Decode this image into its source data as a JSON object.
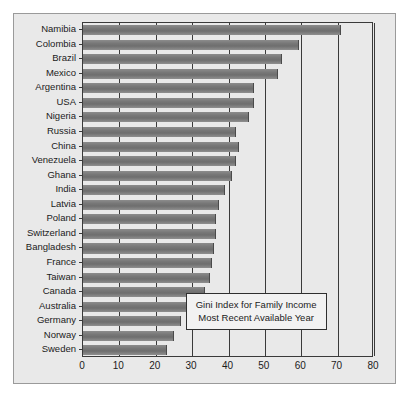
{
  "chart_data": {
    "type": "bar",
    "orientation": "horizontal",
    "title": "",
    "xlabel": "",
    "ylabel": "",
    "xlim": [
      0,
      80
    ],
    "xticks": [
      0,
      10,
      20,
      30,
      40,
      50,
      60,
      70,
      80
    ],
    "grid": true,
    "grid_axis": "x",
    "legend": "none",
    "annotation": {
      "line1": "Gini Index for Family Income",
      "line2": "Most Recent Available Year"
    },
    "categories": [
      "Namibia",
      "Colombia",
      "Brazil",
      "Mexico",
      "Argentina",
      "USA",
      "Nigeria",
      "Russia",
      "China",
      "Venezuela",
      "Ghana",
      "India",
      "Latvia",
      "Poland",
      "Switzerland",
      "Bangladesh",
      "France",
      "Taiwan",
      "Canada",
      "Australia",
      "Germany",
      "Norway",
      "Sweden"
    ],
    "values": [
      71.0,
      59.5,
      54.7,
      53.5,
      47.0,
      47.0,
      45.5,
      42.0,
      43.0,
      42.0,
      41.0,
      39.0,
      37.5,
      36.5,
      36.5,
      36.0,
      35.5,
      35.0,
      33.5,
      30.5,
      27.0,
      25.0,
      23.0
    ],
    "bar_color": "#7a7a7a",
    "plot_background": "#e9e9e9"
  },
  "axis": {
    "tick_labels": [
      "0",
      "10",
      "20",
      "30",
      "40",
      "50",
      "60",
      "70",
      "80"
    ]
  }
}
